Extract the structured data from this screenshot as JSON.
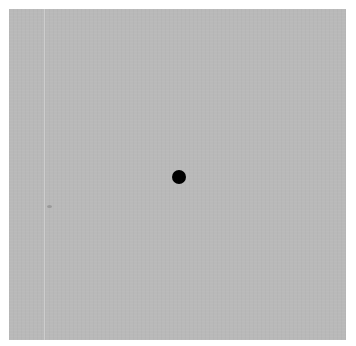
{
  "canvas": {
    "background_color": "#b9b9b9",
    "guide_line_color": "#d2d2d2"
  },
  "target": {
    "shape": "circle",
    "color": "#000000",
    "center_x": 179,
    "center_y": 177,
    "radius": 7
  }
}
